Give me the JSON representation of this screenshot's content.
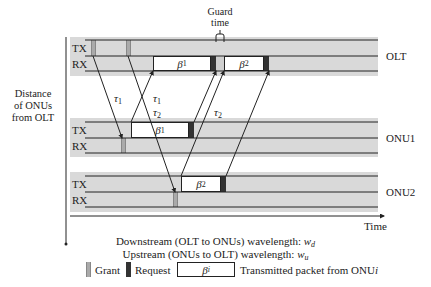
{
  "title": "Guard time",
  "y_axis_label": [
    "Distance",
    "of ONUs",
    "from OLT"
  ],
  "x_axis_label": "Time",
  "nodes": [
    {
      "name": "OLT",
      "rows": [
        "TX",
        "RX"
      ]
    },
    {
      "name": "ONU1",
      "rows": [
        "TX",
        "RX"
      ]
    },
    {
      "name": "ONU2",
      "rows": [
        "TX",
        "RX"
      ]
    }
  ],
  "packets": [
    {
      "label": "β",
      "sub": "1",
      "node": "OLT",
      "row": "RX"
    },
    {
      "label": "β",
      "sub": "2",
      "node": "OLT",
      "row": "RX"
    },
    {
      "label": "β",
      "sub": "1",
      "node": "ONU1",
      "row": "TX"
    },
    {
      "label": "β",
      "sub": "2",
      "node": "ONU2",
      "row": "TX"
    }
  ],
  "delays": [
    {
      "label": "τ",
      "sub": "1"
    },
    {
      "label": "τ",
      "sub": "1"
    },
    {
      "label": "τ",
      "sub": "2"
    },
    {
      "label": "τ",
      "sub": "2"
    }
  ],
  "captions": {
    "downstream": "Downstream (OLT to ONUs) wavelength: ",
    "downstream_var": "w",
    "downstream_sub": "d",
    "upstream": "Upstream (ONUs to OLT) wavelength: ",
    "upstream_var": "w",
    "upstream_sub": "u"
  },
  "legend": {
    "grant": "Grant",
    "request": "Request",
    "packet_symbol": "β",
    "packet_symbol_sub": "i",
    "packet_desc": "Transmitted packet from ONU",
    "packet_desc_var": "i"
  },
  "colors": {
    "band": "#d9d9d9",
    "grant": "#aaaaaa",
    "request": "#333333",
    "line": "#222222"
  }
}
